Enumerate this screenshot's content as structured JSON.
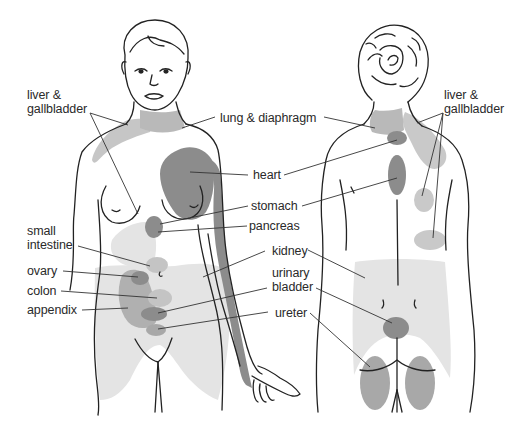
{
  "colors": {
    "light_zone": "#e4e4e4",
    "mid_zone": "#b9b9b9",
    "dark_zone": "#8c8c8c",
    "outline": "#222222",
    "leader": "#333333",
    "text": "#2a2a2a"
  },
  "front_figure": {
    "labels": {
      "liver_gallbladder_1": "liver &",
      "liver_gallbladder_2": "gallbladder",
      "lung_diaphragm": "lung & diaphragm",
      "heart": "heart",
      "stomach": "stomach",
      "pancreas": "pancreas",
      "small_intestine_1": "small",
      "small_intestine_2": "intestine",
      "kidney": "kidney",
      "ovary": "ovary",
      "urinary_bladder_1": "urinary",
      "urinary_bladder_2": "bladder",
      "colon": "colon",
      "appendix": "appendix",
      "ureter": "ureter"
    }
  },
  "back_figure": {
    "labels": {
      "liver_gallbladder_1": "liver &",
      "liver_gallbladder_2": "gallbladder"
    }
  }
}
